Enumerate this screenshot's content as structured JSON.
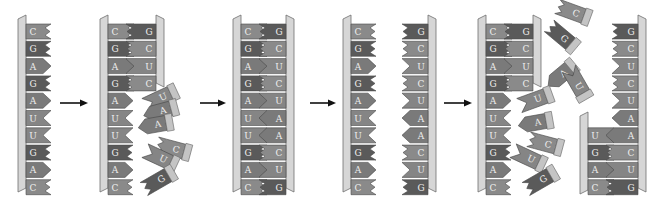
{
  "colors": {
    "backbone_fill": "#d6d6d6",
    "backbone_edge": "#6e6e6e",
    "G": "#5a5a5a",
    "C": "#8a8a8a",
    "A": "#7a7a7a",
    "U": "#858585",
    "label": "#efefef",
    "arrow": "#111111",
    "free_cap": "#c4c4c4"
  },
  "template_strand": [
    "C",
    "G",
    "A",
    "G",
    "A",
    "U",
    "U",
    "G",
    "A",
    "C"
  ],
  "complement_strand": [
    "G",
    "C",
    "U",
    "C",
    "U",
    "A",
    "A",
    "C",
    "U",
    "G"
  ],
  "steps": [
    {
      "id": "step1",
      "caption": "Single template strand",
      "bases": [
        "C",
        "G",
        "A",
        "G",
        "A",
        "U",
        "U",
        "G",
        "A",
        "C"
      ]
    },
    {
      "id": "step2",
      "caption": "Partial complement built; free nucleotides approach",
      "paired": [
        [
          "C",
          "G"
        ],
        [
          "G",
          "C"
        ],
        [
          "A",
          "U"
        ],
        [
          "G",
          "C"
        ]
      ],
      "unpaired": [
        "A",
        "U",
        "U",
        "G",
        "A",
        "C"
      ],
      "free": [
        "U",
        "A",
        "A",
        "C",
        "U",
        "G"
      ]
    },
    {
      "id": "step3",
      "caption": "Double strand complete",
      "pairs": [
        [
          "C",
          "G"
        ],
        [
          "G",
          "C"
        ],
        [
          "A",
          "U"
        ],
        [
          "G",
          "C"
        ],
        [
          "A",
          "U"
        ],
        [
          "U",
          "A"
        ],
        [
          "U",
          "A"
        ],
        [
          "G",
          "C"
        ],
        [
          "A",
          "U"
        ],
        [
          "C",
          "G"
        ]
      ]
    },
    {
      "id": "step4",
      "caption": "Strands separate",
      "left": [
        "C",
        "G",
        "A",
        "G",
        "A",
        "U",
        "U",
        "G",
        "A",
        "C"
      ],
      "right": [
        "G",
        "C",
        "U",
        "C",
        "U",
        "A",
        "A",
        "C",
        "U",
        "G"
      ]
    },
    {
      "id": "step5",
      "caption": "Both strands serve as templates",
      "left_paired": [
        [
          "C",
          "G"
        ],
        [
          "G",
          "C"
        ],
        [
          "A",
          "U"
        ],
        [
          "G",
          "C"
        ]
      ],
      "left_unpaired": [
        "A",
        "U",
        "U",
        "G",
        "A",
        "C"
      ],
      "free": [
        "C",
        "G",
        "A",
        "U",
        "U",
        "A",
        "C",
        "U",
        "G"
      ],
      "right_unpaired": [
        "G",
        "C",
        "U",
        "C",
        "U",
        "A"
      ],
      "right_paired": [
        [
          "U",
          "A"
        ],
        [
          "G",
          "C"
        ],
        [
          "A",
          "U"
        ],
        [
          "C",
          "G"
        ]
      ]
    }
  ],
  "arrows": [
    {
      "label": "step-1-to-2"
    },
    {
      "label": "step-2-to-3"
    },
    {
      "label": "step-3-to-4"
    },
    {
      "label": "step-4-to-5"
    }
  ]
}
